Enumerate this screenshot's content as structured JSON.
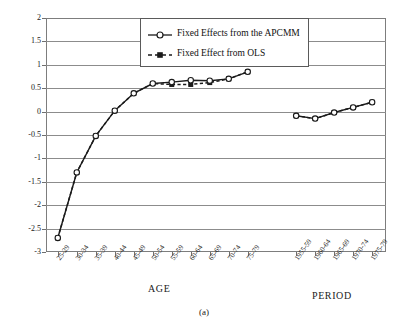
{
  "caption": "(a)",
  "legend": {
    "position": "top-center-inside",
    "entries": [
      {
        "label": "Fixed Effects from the APCMM",
        "marker": "open-circle",
        "line": "solid"
      },
      {
        "label": "Fixed Effect from OLS",
        "marker": "filled-square",
        "line": "dashed"
      }
    ]
  },
  "axis_groups": [
    {
      "name": "age-group-label",
      "label": "AGE"
    },
    {
      "name": "period-group-label",
      "label": "PERIOD"
    }
  ],
  "chart_data": {
    "type": "line",
    "title": "",
    "xlabel": "",
    "ylabel": "",
    "ylim": [
      -3,
      2
    ],
    "ytick_step": 0.5,
    "yticks": [
      2,
      1.5,
      1,
      0.5,
      0,
      -0.5,
      -1,
      -1.5,
      -2,
      -2.5,
      -3
    ],
    "ytick_labels": [
      "2",
      "1.5",
      "1",
      "0.5",
      "0",
      "-0.5",
      "-1",
      "-1.5",
      "-2",
      "-2.5",
      "-3"
    ],
    "grid": true,
    "grid_axis": "y",
    "categories": [
      "25-29",
      "30-34",
      "35-39",
      "40-44",
      "45-49",
      "50-54",
      "55-59",
      "60-64",
      "65-69",
      "70-74",
      "75-79",
      "1955-59",
      "1960-64",
      "1965-69",
      "1970-74",
      "1975-79"
    ],
    "segments": [
      {
        "name": "AGE",
        "categories": [
          "25-29",
          "30-34",
          "35-39",
          "40-44",
          "45-49",
          "50-54",
          "55-59",
          "60-64",
          "65-69",
          "70-74",
          "75-79"
        ],
        "series": [
          {
            "name": "Fixed Effects from the APCMM",
            "values": [
              -2.7,
              -1.3,
              -0.52,
              0.02,
              0.39,
              0.6,
              0.63,
              0.67,
              0.66,
              0.7,
              0.85
            ]
          },
          {
            "name": "Fixed Effect from OLS",
            "values": [
              -2.7,
              -1.3,
              -0.52,
              0.02,
              0.39,
              0.6,
              0.58,
              0.58,
              0.62,
              0.7,
              0.85
            ]
          }
        ]
      },
      {
        "name": "PERIOD",
        "categories": [
          "1955-59",
          "1960-64",
          "1965-69",
          "1970-74",
          "1975-79"
        ],
        "series": [
          {
            "name": "Fixed Effects from the APCMM",
            "values": [
              -0.09,
              -0.15,
              -0.02,
              0.09,
              0.2
            ]
          },
          {
            "name": "Fixed Effect from OLS",
            "values": [
              -0.09,
              -0.15,
              -0.02,
              0.09,
              0.2
            ]
          }
        ]
      }
    ],
    "legend_entries": [
      "Fixed Effects from the APCMM",
      "Fixed Effect from OLS"
    ]
  }
}
